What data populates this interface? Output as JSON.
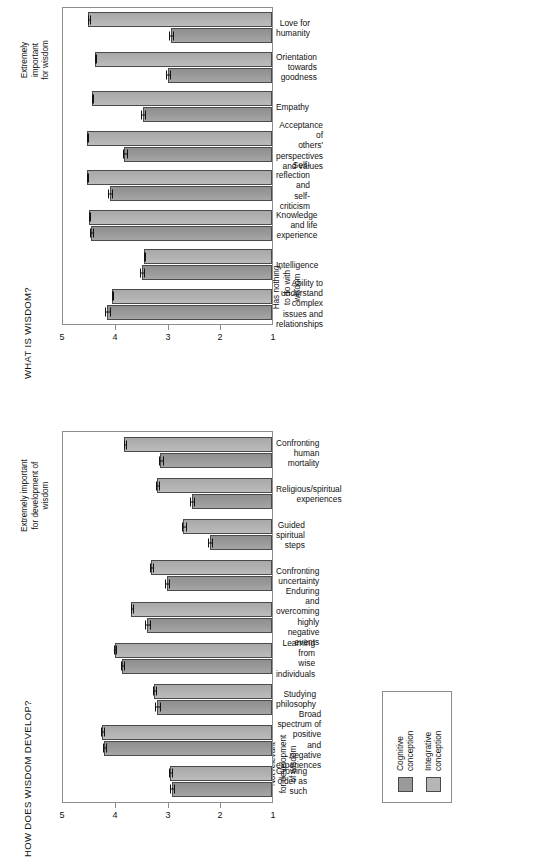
{
  "figure": {
    "orientation": "rotated-90-ccw"
  },
  "legend": {
    "items": [
      {
        "label": "Cognitive\nconception",
        "color": "#9a9a9a",
        "key": "cognitive"
      },
      {
        "label": "Integrative\nconception",
        "color": "#b6b6b6",
        "key": "integrative"
      }
    ]
  },
  "panels": [
    {
      "id": "how-does-wisdom-develop",
      "title": "HOW DOES WISDOM DEVELOP?",
      "low_anchor": "Not relevant\nfor development\nof wisdom",
      "high_anchor": "Extremely important\nfor development of\nwisdom"
    },
    {
      "id": "what-is-wisdom",
      "title": "WHAT IS WISDOM?",
      "low_anchor": "Has nothing\nto do with\nwisdom",
      "high_anchor": "Extremely\nimportant\nfor wisdom"
    }
  ],
  "chart_data": [
    {
      "type": "bar",
      "id": "how-does-wisdom-develop",
      "title": "HOW DOES WISDOM DEVELOP?",
      "xlabel": "",
      "ylabel": "",
      "ylim": [
        1,
        5
      ],
      "yticks": [
        1,
        2,
        3,
        4,
        5
      ],
      "ytick_labels": [
        "1",
        "2",
        "3",
        "4",
        "5"
      ],
      "grid": false,
      "legend_position": "left-outside",
      "orientation": "vertical-bars",
      "categories": [
        "Growing older as such",
        "Broad spectrum of positive\nand negative experiences",
        "Studying philosophy",
        "Learning from\nwise individuals",
        "Enduring and\novercoming highly\nnegative events",
        "Confronting uncertainty",
        "Guided spiritual steps",
        "Religious/spiritual\nexperiences",
        "Confronting human\nmortality"
      ],
      "series": [
        {
          "name": "Cognitive conception",
          "color": "#9a9a9a",
          "values": [
            2.9,
            4.19,
            3.18,
            3.84,
            3.37,
            3.0,
            2.18,
            2.52,
            3.12
          ],
          "errors": [
            0.05,
            0.04,
            0.05,
            0.04,
            0.05,
            0.05,
            0.05,
            0.05,
            0.05
          ]
        },
        {
          "name": "Integrative conception",
          "color": "#b6b6b6",
          "values": [
            2.93,
            4.23,
            3.24,
            3.98,
            3.67,
            3.3,
            2.68,
            3.18,
            3.8
          ],
          "errors": [
            0.04,
            0.04,
            0.04,
            0.03,
            0.03,
            0.04,
            0.04,
            0.04,
            0.03
          ]
        }
      ]
    },
    {
      "type": "bar",
      "id": "what-is-wisdom",
      "title": "WHAT IS WISDOM?",
      "xlabel": "",
      "ylabel": "",
      "ylim": [
        1,
        5
      ],
      "yticks": [
        1,
        2,
        3,
        4,
        5
      ],
      "ytick_labels": [
        "1",
        "2",
        "3",
        "4",
        "5"
      ],
      "grid": false,
      "legend_position": "shared",
      "orientation": "vertical-bars",
      "categories": [
        "Ability to understand\ncomplex issues and\nrelationships",
        "Intelligence",
        "Knowledge and life\nexperience",
        "Self-reflection and\nself-criticism",
        "Acceptance of\nothers' perspectives\nand values",
        "Empathy",
        "Orientation towards\ngoodness",
        "Love for humanity"
      ],
      "series": [
        {
          "name": "Cognitive conception",
          "color": "#9a9a9a",
          "values": [
            4.13,
            3.47,
            4.43,
            4.08,
            3.8,
            3.45,
            2.98,
            2.92
          ],
          "errors": [
            0.05,
            0.05,
            0.04,
            0.05,
            0.05,
            0.05,
            0.05,
            0.05
          ]
        },
        {
          "name": "Integrative conception",
          "color": "#b6b6b6",
          "values": [
            4.03,
            3.42,
            4.47,
            4.51,
            4.5,
            4.41,
            4.35,
            4.48
          ],
          "errors": [
            0.02,
            0.02,
            0.02,
            0.02,
            0.02,
            0.02,
            0.02,
            0.02
          ]
        }
      ]
    }
  ]
}
